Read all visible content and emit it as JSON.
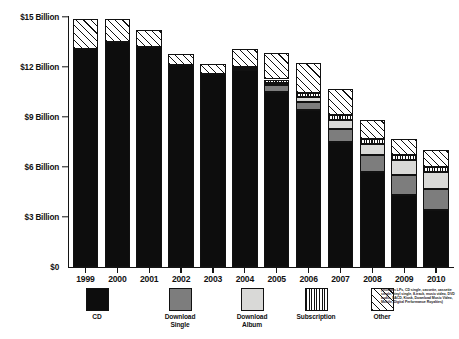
{
  "chart_data": {
    "type": "bar",
    "subtype": "stacked-bar",
    "title": "",
    "xlabel": "",
    "ylabel": "",
    "ylim": [
      0,
      15
    ],
    "yunit": "Billion",
    "grid": false,
    "legend_position": "bottom",
    "categories": [
      "1999",
      "2000",
      "2001",
      "2002",
      "2003",
      "2004",
      "2005",
      "2006",
      "2007",
      "2008",
      "2009",
      "2010"
    ],
    "ytick_labels": [
      "$0",
      "$3 Billion",
      "$6 Billion",
      "$9 Billion",
      "$12 Billion",
      "$15 Billion"
    ],
    "ytick_values": [
      0,
      3,
      6,
      9,
      12,
      15
    ],
    "series": [
      {
        "name": "CD",
        "color": "#0d0d0d",
        "pattern": "solid",
        "values": [
          13.1,
          13.5,
          13.2,
          12.1,
          11.6,
          11.8,
          10.5,
          9.4,
          7.5,
          5.7,
          4.3,
          3.4
        ]
      },
      {
        "name": "Download Single",
        "color": "#7d7d7d",
        "pattern": "solid-gray",
        "values": [
          0,
          0,
          0,
          0,
          0,
          0.1,
          0.4,
          0.5,
          0.8,
          1.0,
          1.2,
          1.3
        ]
      },
      {
        "name": "Download Album",
        "color": "#d9d9d7",
        "pattern": "solid-light",
        "values": [
          0,
          0,
          0,
          0,
          0,
          0.05,
          0.15,
          0.3,
          0.5,
          0.7,
          0.9,
          1.0
        ]
      },
      {
        "name": "Subscription",
        "color": "#ffffff",
        "pattern": "vertical-stripes",
        "values": [
          0,
          0,
          0,
          0,
          0,
          0.05,
          0.2,
          0.25,
          0.3,
          0.3,
          0.3,
          0.3
        ]
      },
      {
        "name": "Other",
        "color": "#ffffff",
        "pattern": "diagonal-hatch",
        "values": [
          1.8,
          1.4,
          1.0,
          0.7,
          0.6,
          1.1,
          1.6,
          1.8,
          1.6,
          1.1,
          1.0,
          1.0
        ]
      }
    ],
    "totals": [
      14.9,
      14.9,
      14.2,
      12.8,
      12.2,
      13.1,
      12.85,
      12.25,
      10.7,
      8.8,
      7.7,
      7.0
    ]
  },
  "legend": {
    "items": [
      {
        "label": "CD",
        "pattern": "solid"
      },
      {
        "label": "Download\nSingle",
        "pattern": "solid-gray"
      },
      {
        "label": "Download\nAlbum",
        "pattern": "solid-light"
      },
      {
        "label": "Subscription",
        "pattern": "vertical-stripes"
      },
      {
        "label": "Other",
        "pattern": "diagonal-hatch"
      }
    ],
    "other_note": "(includes LPs, CD single, cassette, cassette single, vinyl single, 8-track, music video, DVD audio, SACD, Kiosk, Download Music Video, Mobile, Digital Performance Royalties)"
  }
}
